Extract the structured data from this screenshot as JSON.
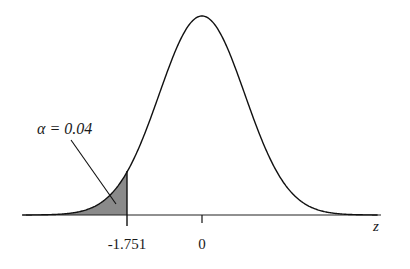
{
  "chart_data": {
    "type": "area",
    "title": "",
    "distribution": "standard normal",
    "xlabel": "z",
    "ylabel": "",
    "tick_labels": [
      "-1.751",
      "0"
    ],
    "ticks": [
      -1.751,
      0
    ],
    "critical_value": -1.751,
    "tail": "left",
    "shaded_area": 0.04,
    "annotation": "α = 0.04",
    "xlim": [
      -4.2,
      4.1
    ],
    "grid": false,
    "legend": "none",
    "colors": {
      "curve": "#111111",
      "shade": "#8a8a8a",
      "axis": "#222222"
    }
  },
  "labels": {
    "alpha": "α = 0.04",
    "critical": "-1.751",
    "zero": "0",
    "axis": "z"
  }
}
